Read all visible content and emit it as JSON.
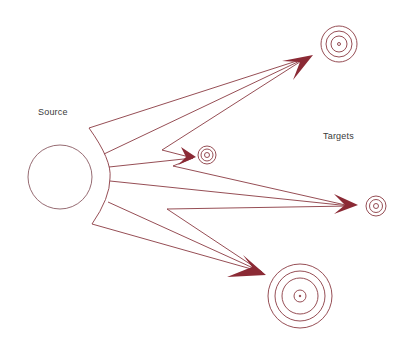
{
  "labels": {
    "source": "Source",
    "targets": "Targets"
  },
  "colors": {
    "line": "#8a3a42",
    "arrowhead": "#8b2a35",
    "source_circle": "#8a5a62",
    "background": "#ffffff"
  },
  "source": {
    "cx": 60,
    "cy": 177,
    "r": 32
  },
  "targets": [
    {
      "id": "target-top",
      "cx": 339,
      "cy": 44,
      "rings": [
        18,
        13,
        8,
        2
      ]
    },
    {
      "id": "target-middle",
      "cx": 207,
      "cy": 155,
      "rings": [
        9,
        6,
        2
      ]
    },
    {
      "id": "target-right",
      "cx": 376,
      "cy": 206,
      "rings": [
        10,
        6,
        2
      ]
    },
    {
      "id": "target-bottom",
      "cx": 300,
      "cy": 296,
      "rings": [
        32,
        25,
        18,
        7
      ]
    }
  ]
}
